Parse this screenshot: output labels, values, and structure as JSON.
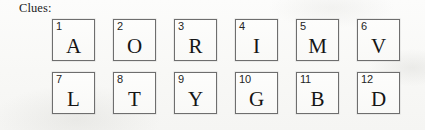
{
  "page": {
    "label": "Clues:",
    "background_color": "#fbfbfa",
    "box_border_color": "#6e6e6e",
    "text_color": "#1a1a1a"
  },
  "clues": {
    "columns": 6,
    "rows": 2,
    "items": [
      {
        "number": "1",
        "letter": "A"
      },
      {
        "number": "2",
        "letter": "O"
      },
      {
        "number": "3",
        "letter": "R"
      },
      {
        "number": "4",
        "letter": "I"
      },
      {
        "number": "5",
        "letter": "M"
      },
      {
        "number": "6",
        "letter": "V"
      },
      {
        "number": "7",
        "letter": "L"
      },
      {
        "number": "8",
        "letter": "T"
      },
      {
        "number": "9",
        "letter": "Y"
      },
      {
        "number": "10",
        "letter": "G"
      },
      {
        "number": "11",
        "letter": "B"
      },
      {
        "number": "12",
        "letter": "D"
      }
    ]
  }
}
